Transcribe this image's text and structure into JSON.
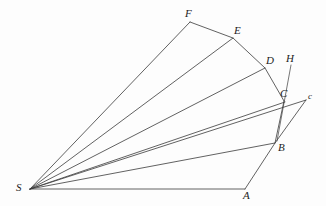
{
  "figure": {
    "background_color": "#fdfdfd",
    "stroke_color": "#3a3a3a",
    "width": 326,
    "height": 206,
    "vertices": [
      {
        "id": "S",
        "label": "S",
        "x": 30,
        "y": 189,
        "label_x": 16,
        "label_y": 182,
        "size": "normal"
      },
      {
        "id": "A",
        "label": "A",
        "x": 245,
        "y": 189,
        "label_x": 243,
        "label_y": 190,
        "size": "normal"
      },
      {
        "id": "B",
        "label": "B",
        "x": 275,
        "y": 143,
        "label_x": 278,
        "label_y": 142,
        "size": "normal"
      },
      {
        "id": "C",
        "label": "C",
        "x": 283,
        "y": 101,
        "label_x": 280,
        "label_y": 88,
        "size": "normal"
      },
      {
        "id": "c",
        "label": "c",
        "x": 306,
        "y": 100,
        "label_x": 308,
        "label_y": 92,
        "size": "small"
      },
      {
        "id": "D",
        "label": "D",
        "x": 265,
        "y": 68,
        "label_x": 266,
        "label_y": 55,
        "size": "normal"
      },
      {
        "id": "E",
        "label": "E",
        "x": 233,
        "y": 38,
        "label_x": 234,
        "label_y": 25,
        "size": "normal"
      },
      {
        "id": "F",
        "label": "F",
        "x": 190,
        "y": 22,
        "label_x": 185,
        "label_y": 8,
        "size": "normal"
      },
      {
        "id": "H",
        "label": "H",
        "x": 291,
        "y": 65,
        "label_x": 286,
        "label_y": 53,
        "size": "normal"
      }
    ],
    "rays_from_apex": [
      {
        "name": "ray-S-A",
        "from": "S",
        "to": "A"
      },
      {
        "name": "ray-S-B",
        "from": "S",
        "to": "B"
      },
      {
        "name": "ray-S-C",
        "from": "S",
        "to": "C"
      },
      {
        "name": "ray-S-c",
        "from": "S",
        "to": "c"
      },
      {
        "name": "ray-S-D",
        "from": "S",
        "to": "D"
      },
      {
        "name": "ray-S-E",
        "from": "S",
        "to": "E"
      },
      {
        "name": "ray-S-F",
        "from": "S",
        "to": "F"
      }
    ],
    "chain": {
      "name": "polyline-A-B-C-D-E-F",
      "points": "A,B,C,D,E,F"
    },
    "extra_segments": [
      {
        "name": "segment-B-c",
        "from": "B",
        "to": "c"
      },
      {
        "name": "segment-H",
        "from": "H",
        "to_x": 277,
        "to_y": 141
      }
    ],
    "paths": {
      "ray_S_A": "M 30 189 L 245 189",
      "ray_S_B": "M 30 189 L 275 143",
      "ray_S_C": "M 30 189 L 285 102",
      "ray_S_c": "M 30 189 L 306 100",
      "ray_S_D": "M 30 189 L 265 68",
      "ray_S_E": "M 30 189 L 233 38",
      "ray_S_F": "M 30 189 L 190 22",
      "chain_A_B_C": "M 245 189 L 275 143 L 284 101",
      "chain_C_D_E_F": "M 284 101 L 265 68 L 233 38 L 190 22",
      "segment_B_c": "M 275 143 L 306 100",
      "segment_H": "M 291 65 L 277 141"
    }
  }
}
